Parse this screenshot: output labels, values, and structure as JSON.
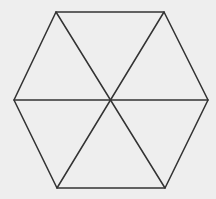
{
  "diagram": {
    "type": "regular-hexagon-triangulated",
    "background_color": "#eeeeee",
    "line_color": "#333333",
    "center": [
      111,
      100
    ],
    "vertices": [
      [
        56,
        12
      ],
      [
        164,
        12
      ],
      [
        208,
        100
      ],
      [
        165,
        188
      ],
      [
        57,
        188
      ],
      [
        14,
        100
      ]
    ],
    "spokes": [
      [
        [
          56,
          12
        ],
        [
          165,
          188
        ]
      ],
      [
        [
          164,
          12
        ],
        [
          57,
          188
        ]
      ],
      [
        [
          14,
          100
        ],
        [
          208,
          100
        ]
      ]
    ],
    "triangle_count": 6
  }
}
